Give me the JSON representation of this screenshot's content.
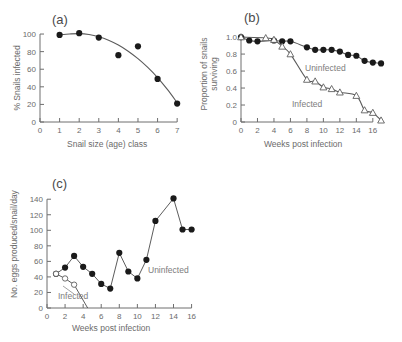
{
  "figure": {
    "panels": [
      "a",
      "b",
      "c"
    ]
  },
  "panel_a": {
    "label": "(a)",
    "xlabel": "Snail size (age) class",
    "ylabel": "% Snails infected",
    "xticks": [
      "0",
      "1",
      "2",
      "3",
      "4",
      "5",
      "6",
      "7"
    ],
    "yticks": [
      "0",
      "20",
      "40",
      "60",
      "80",
      "100"
    ]
  },
  "panel_b": {
    "label": "(b)",
    "xlabel": "Weeks post infection",
    "ylabel_line1": "Proportion of snails",
    "ylabel_line2": "surviving",
    "xticks": [
      "0",
      "2",
      "4",
      "6",
      "8",
      "10",
      "12",
      "14",
      "16"
    ],
    "yticks": [
      "0",
      "0.2",
      "0.4",
      "0.6",
      "0.8",
      "1.0"
    ],
    "annotation_uninfected": "Uninfected",
    "annotation_infected": "Infected"
  },
  "panel_c": {
    "label": "(c)",
    "xlabel": "Weeks post infection",
    "ylabel": "No. eggs produced/snail/day",
    "xticks": [
      "0",
      "2",
      "4",
      "6",
      "8",
      "10",
      "12",
      "14",
      "16"
    ],
    "yticks": [
      "0",
      "20",
      "40",
      "60",
      "80",
      "100",
      "120",
      "140"
    ],
    "annotation_uninfected": "Uninfected",
    "annotation_infected": "Infected"
  },
  "chart_data": [
    {
      "type": "scatter",
      "panel": "a",
      "title": "(a)",
      "xlabel": "Snail size (age) class",
      "ylabel": "% Snails infected",
      "xlim": [
        0,
        7.4
      ],
      "ylim": [
        0,
        108
      ],
      "xticks": [
        0,
        1,
        2,
        3,
        4,
        5,
        6,
        7
      ],
      "yticks": [
        0,
        20,
        40,
        60,
        80,
        100
      ],
      "grid": false,
      "legend": "none",
      "series": [
        {
          "name": "% Snails infected",
          "marker": "filled-circle",
          "x": [
            1,
            2,
            3,
            4,
            5,
            6,
            7
          ],
          "values": [
            99,
            101,
            96,
            76,
            86,
            49,
            21
          ]
        }
      ],
      "fitted_curve": {
        "name": "fitted curve",
        "x": [
          1,
          1.5,
          2,
          2.5,
          3,
          3.5,
          4,
          4.5,
          5,
          5.5,
          6,
          6.5,
          7
        ],
        "values": [
          99,
          100,
          100.5,
          99.5,
          97,
          93,
          87.5,
          80.5,
          72,
          62,
          50.5,
          37,
          22
        ]
      }
    },
    {
      "type": "line",
      "panel": "b",
      "title": "(b)",
      "xlabel": "Weeks post infection",
      "ylabel": "Proportion of snails surviving",
      "xlim": [
        0,
        17.6
      ],
      "ylim": [
        0,
        1.06
      ],
      "xticks": [
        0,
        2,
        4,
        6,
        8,
        10,
        12,
        14,
        16
      ],
      "yticks": [
        0,
        0.2,
        0.4,
        0.6,
        0.8,
        1.0
      ],
      "grid": false,
      "legend": "inline-annotation",
      "series": [
        {
          "name": "Uninfected",
          "marker": "filled-circle",
          "x": [
            0,
            1,
            2,
            4,
            5,
            6,
            8,
            9,
            10,
            11,
            12,
            13,
            14,
            15,
            16,
            17
          ],
          "values": [
            1.0,
            0.96,
            0.95,
            0.96,
            0.95,
            0.95,
            0.88,
            0.85,
            0.85,
            0.85,
            0.83,
            0.79,
            0.78,
            0.72,
            0.7,
            0.69
          ]
        },
        {
          "name": "Infected",
          "marker": "open-triangle",
          "x": [
            0,
            3,
            4,
            5,
            6,
            8,
            9,
            10,
            11,
            12,
            14,
            15,
            16,
            17
          ],
          "values": [
            1.0,
            0.99,
            0.97,
            0.89,
            0.8,
            0.5,
            0.48,
            0.41,
            0.39,
            0.35,
            0.31,
            0.14,
            0.11,
            0.02
          ]
        }
      ]
    },
    {
      "type": "line",
      "panel": "c",
      "title": "(c)",
      "xlabel": "Weeks post infection",
      "ylabel": "No. eggs produced/snail/day",
      "xlim": [
        0,
        16.6
      ],
      "ylim": [
        0,
        148
      ],
      "xticks": [
        0,
        2,
        4,
        6,
        8,
        10,
        12,
        14,
        16
      ],
      "yticks": [
        0,
        20,
        40,
        60,
        80,
        100,
        120,
        140
      ],
      "grid": false,
      "legend": "inline-annotation",
      "series": [
        {
          "name": "Uninfected",
          "marker": "filled-circle",
          "x": [
            1,
            2,
            3,
            4,
            5,
            6,
            7,
            8,
            9,
            10,
            11,
            12,
            14,
            15,
            16
          ],
          "values": [
            44,
            52,
            67,
            53,
            44,
            31,
            25,
            71,
            47,
            38,
            62,
            112,
            141,
            101,
            101
          ]
        },
        {
          "name": "Infected",
          "marker": "open-circle",
          "x": [
            1,
            2,
            3,
            4.5
          ],
          "values": [
            44,
            38,
            30,
            0
          ]
        }
      ]
    }
  ]
}
